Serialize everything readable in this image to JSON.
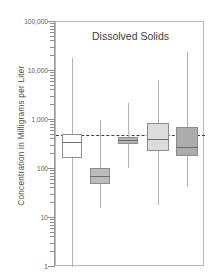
{
  "chart_data": {
    "type": "box",
    "title": "Dissolved Solids",
    "xlabel": "",
    "ylabel": "Concentration  in  Milligrams  per  Liter",
    "yscale": "log",
    "ylim": [
      1,
      100000
    ],
    "ytick_labels": [
      "100,000",
      "10,000",
      "1,000",
      "100",
      "10",
      "1"
    ],
    "ytick_values": [
      100000,
      10000,
      1000,
      100,
      10,
      1
    ],
    "grid": false,
    "legend": "none",
    "reference_line": {
      "value": 500,
      "style": "dashed",
      "color": "#3f3f3f"
    },
    "boxes": [
      {
        "index": 1,
        "fill": "#ffffff",
        "whisker_low": 1,
        "q1": 170,
        "median": 350,
        "q3": 520,
        "whisker_high": 18000
      },
      {
        "index": 2,
        "fill": "#bcbcbc",
        "whisker_low": 16,
        "q1": 50,
        "median": 72,
        "q3": 105,
        "whisker_high": 980
      },
      {
        "index": 3,
        "fill": "#b4b4b4",
        "whisker_low": 105,
        "q1": 330,
        "median": 390,
        "q3": 460,
        "whisker_high": 2200
      },
      {
        "index": 4,
        "fill": "#dcdcdc",
        "whisker_low": 18,
        "q1": 235,
        "median": 400,
        "q3": 880,
        "whisker_high": 6500
      },
      {
        "index": 5,
        "fill": "#acacac",
        "whisker_low": 42,
        "q1": 185,
        "median": 280,
        "q3": 720,
        "whisker_high": 25000
      }
    ]
  }
}
